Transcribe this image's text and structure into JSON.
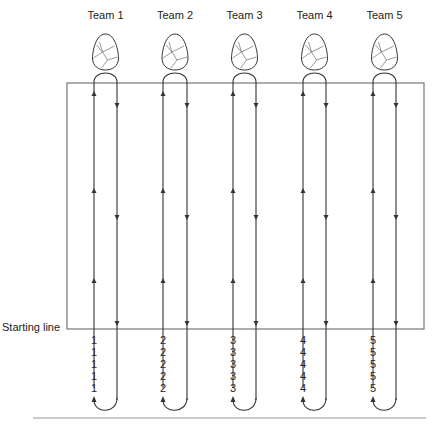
{
  "diagram": {
    "title": "",
    "start_label": "Starting line",
    "teams": [
      {
        "label": "Team 1",
        "number": "1",
        "up_x": 94,
        "down_x": 117
      },
      {
        "label": "Team 2",
        "number": "2",
        "up_x": 163,
        "down_x": 187
      },
      {
        "label": "Team 3",
        "number": "3",
        "up_x": 233,
        "down_x": 256
      },
      {
        "label": "Team 4",
        "number": "4",
        "up_x": 303,
        "down_x": 326
      },
      {
        "label": "Team 5",
        "number": "5",
        "up_x": 373,
        "down_x": 396
      }
    ],
    "queue_rows": 5,
    "field": {
      "x1": 67,
      "y1": 83,
      "x2": 424,
      "y2": 329
    },
    "line_color": "#333333",
    "border_color": "#777777",
    "rule_color": "#999999",
    "icon": "egg-icon"
  }
}
